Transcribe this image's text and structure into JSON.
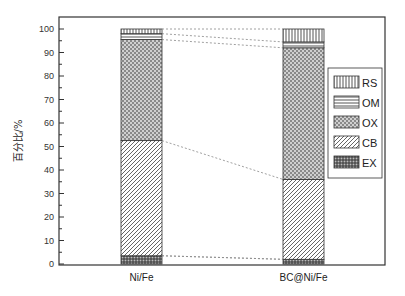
{
  "chart_data": {
    "type": "bar",
    "stacked": true,
    "title": "",
    "xlabel": "",
    "ylabel": "百分比/%",
    "ylim": [
      0,
      100
    ],
    "yticks": [
      0,
      10,
      20,
      30,
      40,
      50,
      60,
      70,
      80,
      90,
      100
    ],
    "categories": [
      "Ni/Fe",
      "BC@Ni/Fe"
    ],
    "series": [
      {
        "name": "EX",
        "pattern": "grid",
        "values": [
          3.5,
          2.0
        ]
      },
      {
        "name": "CB",
        "pattern": "diagonal",
        "values": [
          49.0,
          34.0
        ]
      },
      {
        "name": "OX",
        "pattern": "checker",
        "values": [
          43.0,
          56.0
        ]
      },
      {
        "name": "OM",
        "pattern": "horizontal",
        "values": [
          2.5,
          2.5
        ]
      },
      {
        "name": "RS",
        "pattern": "vertical",
        "values": [
          2.0,
          5.5
        ]
      }
    ],
    "legend": {
      "position": "right-inside",
      "order": [
        "RS",
        "OM",
        "OX",
        "CB",
        "EX"
      ]
    },
    "connector_lines": "dashed, joining segment boundaries between bars",
    "grid": false
  }
}
